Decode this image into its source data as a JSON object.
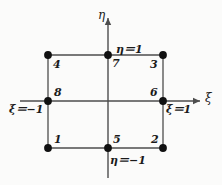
{
  "figure": {
    "background_color": "#fbfbfa",
    "line_color": "#4d4d4d",
    "axis_color": "#4d4d4d",
    "node_color": "#111111"
  },
  "axes": {
    "horizontal": {
      "name": "xi-axis",
      "label": "ξ",
      "x_start": 20,
      "x_end": 200,
      "y": 101,
      "arrow": "right"
    },
    "vertical": {
      "name": "eta-axis",
      "label": "η",
      "y_start": 178,
      "y_end": 18,
      "x": 108,
      "arrow": "up"
    }
  },
  "element": {
    "shape": "square",
    "left": 48,
    "right": 163,
    "top": 55,
    "bottom": 148,
    "internal_gridlines": true
  },
  "nodes": [
    {
      "id": "1",
      "label": "1",
      "x": 48,
      "y": 148,
      "label_dx": 6,
      "label_dy": -14,
      "xi": -1,
      "eta": -1
    },
    {
      "id": "2",
      "label": "2",
      "x": 163,
      "y": 148,
      "label_dx": -12,
      "label_dy": -14,
      "xi": 1,
      "eta": -1
    },
    {
      "id": "3",
      "label": "3",
      "x": 163,
      "y": 55,
      "label_dx": -13,
      "label_dy": 4,
      "xi": 1,
      "eta": 1
    },
    {
      "id": "4",
      "label": "4",
      "x": 48,
      "y": 55,
      "label_dx": 5,
      "label_dy": 4,
      "xi": -1,
      "eta": 1
    },
    {
      "id": "5",
      "label": "5",
      "x": 108,
      "y": 148,
      "label_dx": 5,
      "label_dy": -14,
      "xi": 0,
      "eta": -1
    },
    {
      "id": "6",
      "label": "6",
      "x": 163,
      "y": 101,
      "label_dx": -13,
      "label_dy": -14,
      "xi": 1,
      "eta": 0
    },
    {
      "id": "7",
      "label": "7",
      "x": 108,
      "y": 55,
      "label_dx": 4,
      "label_dy": 3,
      "xi": 0,
      "eta": 1
    },
    {
      "id": "8",
      "label": "8",
      "x": 48,
      "y": 101,
      "label_dx": 6,
      "label_dy": -14,
      "xi": -1,
      "eta": 0
    }
  ],
  "coordinate_labels": [
    {
      "name": "eta-equals-one",
      "text": "η＝1",
      "x": 116,
      "y": 44
    },
    {
      "name": "eta-equals-minus-one",
      "text": "η＝−1",
      "x": 110,
      "y": 155
    },
    {
      "name": "xi-equals-minus-one",
      "text": "ξ＝−1",
      "x": 9,
      "y": 104
    },
    {
      "name": "xi-equals-one",
      "text": "ξ＝1",
      "x": 166,
      "y": 104
    }
  ],
  "axis_labels": [
    {
      "name": "eta-axis-label",
      "text": "η",
      "x": 98,
      "y": 9
    },
    {
      "name": "xi-axis-label",
      "text": "ξ",
      "x": 205,
      "y": 92
    }
  ]
}
